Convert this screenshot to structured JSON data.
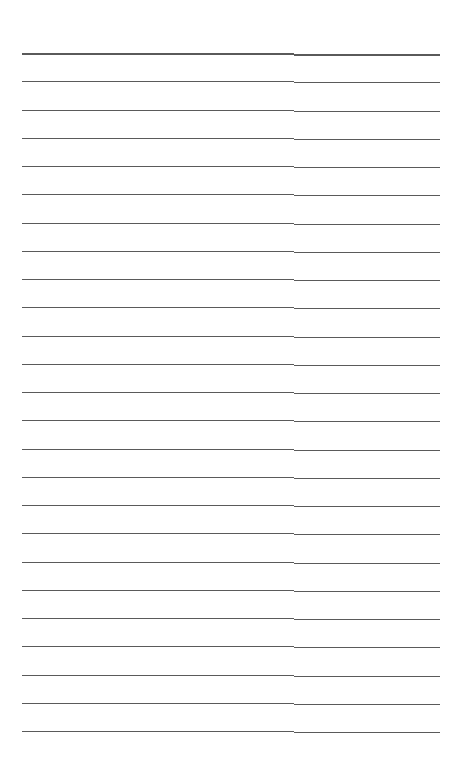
{
  "page": {
    "type": "ruled-sheet",
    "line_count": 25,
    "first_line_y": 53,
    "line_spacing": 28.25,
    "line_color": "#5a5a5a",
    "columns": [
      {
        "name": "left-column",
        "x_start": 22,
        "x_end": 294
      },
      {
        "name": "right-column",
        "x_start": 294,
        "x_end": 440
      }
    ]
  }
}
